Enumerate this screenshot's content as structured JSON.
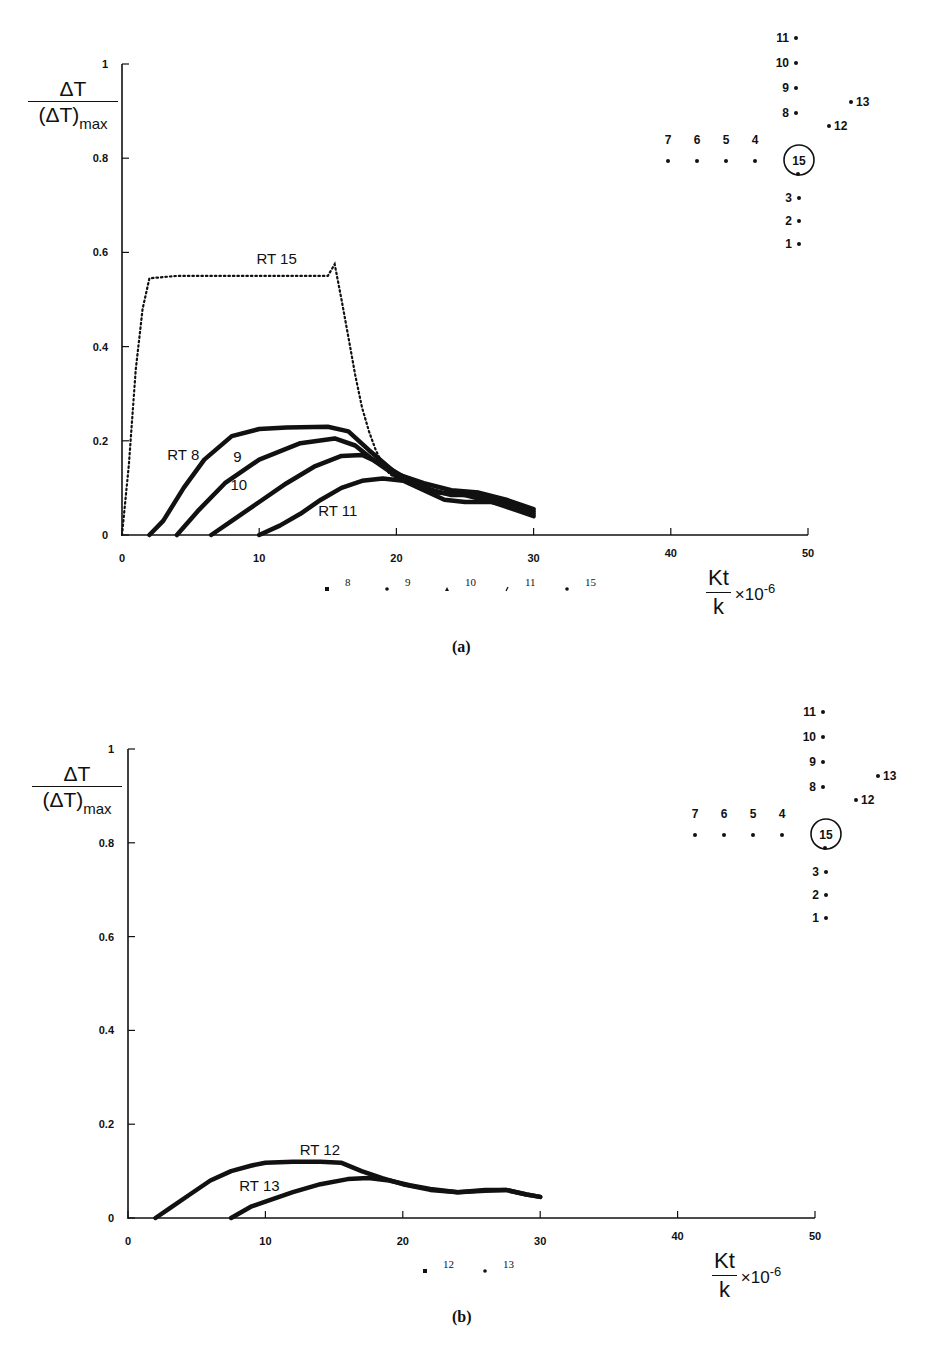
{
  "panels": [
    {
      "caption": "(a)",
      "y_axis_label": {
        "numerator": "ΔT",
        "denominator": "(ΔT)",
        "subscript": "max"
      },
      "x_axis_label": {
        "numerator": "Kt",
        "denominator": "k",
        "multiplier": "×10",
        "exponent": "-6"
      },
      "legend": [
        {
          "marker": "square",
          "label": "8"
        },
        {
          "marker": "dot",
          "label": "9"
        },
        {
          "marker": "triangle",
          "label": "10"
        },
        {
          "marker": "tick",
          "label": "11"
        },
        {
          "marker": "dot",
          "label": "15"
        }
      ],
      "curve_labels": [
        {
          "text": "RT 15",
          "x": 9.8,
          "y": 0.575
        },
        {
          "text": "RT 8",
          "x": 3.3,
          "y": 0.16
        },
        {
          "text": "9",
          "x": 8.1,
          "y": 0.155
        },
        {
          "text": "10",
          "x": 7.9,
          "y": 0.095
        },
        {
          "text": "RT 11",
          "x": 14.3,
          "y": 0.04
        }
      ],
      "sensor_diagram": {
        "vertical_up": [
          "11",
          "10",
          "9",
          "8"
        ],
        "horizontal_left": [
          "7",
          "6",
          "5",
          "4"
        ],
        "vertical_down": [
          "3",
          "2",
          "1"
        ],
        "diagonal": [
          "12",
          "13"
        ],
        "center": "15"
      }
    },
    {
      "caption": "(b)",
      "y_axis_label": {
        "numerator": "ΔT",
        "denominator": "(ΔT)",
        "subscript": "max"
      },
      "x_axis_label": {
        "numerator": "Kt",
        "denominator": "k",
        "multiplier": "×10",
        "exponent": "-6"
      },
      "legend": [
        {
          "marker": "square",
          "label": "12"
        },
        {
          "marker": "dot",
          "label": "13"
        }
      ],
      "curve_labels": [
        {
          "text": "RT 12",
          "x": 12.5,
          "y": 0.135
        },
        {
          "text": "RT 13",
          "x": 8.1,
          "y": 0.058
        }
      ],
      "sensor_diagram": {
        "vertical_up": [
          "11",
          "10",
          "9",
          "8"
        ],
        "horizontal_left": [
          "7",
          "6",
          "5",
          "4"
        ],
        "vertical_down": [
          "3",
          "2",
          "1"
        ],
        "diagonal": [
          "12",
          "13"
        ],
        "center": "15"
      }
    }
  ],
  "chart_data": [
    {
      "type": "scatter",
      "title": "(a)",
      "xlabel": "Kt/k ×10^-6",
      "ylabel": "ΔT/(ΔT)max",
      "xlim": [
        0,
        50
      ],
      "ylim": [
        0,
        1
      ],
      "x_ticks": [
        0,
        10,
        20,
        30,
        40,
        50
      ],
      "y_ticks": [
        0,
        0.2,
        0.4,
        0.6,
        0.8,
        1
      ],
      "grid": false,
      "legend_position": "below x-axis",
      "series": [
        {
          "name": "RT 15",
          "marker": "dot",
          "x": [
            0,
            0.5,
            1.0,
            1.5,
            2.0,
            4,
            6,
            8,
            10,
            12,
            14,
            15,
            15.5,
            16,
            16.5,
            17,
            17.5,
            18,
            18.5,
            19,
            19.5,
            20
          ],
          "y": [
            0,
            0.15,
            0.35,
            0.48,
            0.545,
            0.55,
            0.55,
            0.55,
            0.55,
            0.55,
            0.55,
            0.55,
            0.575,
            0.5,
            0.42,
            0.34,
            0.27,
            0.22,
            0.18,
            0.15,
            0.13,
            0.12
          ]
        },
        {
          "name": "RT 8",
          "marker": "square",
          "x": [
            2,
            3,
            4.5,
            6,
            8,
            10,
            12,
            15,
            16.5,
            18,
            20,
            22,
            24,
            26,
            28,
            30
          ],
          "y": [
            0,
            0.03,
            0.1,
            0.16,
            0.21,
            0.225,
            0.228,
            0.23,
            0.22,
            0.18,
            0.13,
            0.11,
            0.095,
            0.09,
            0.075,
            0.055
          ]
        },
        {
          "name": "9",
          "marker": "dot",
          "x": [
            4,
            5.5,
            7.5,
            10,
            13,
            15.5,
            17,
            18.5,
            20,
            22,
            24,
            26,
            28,
            30
          ],
          "y": [
            0,
            0.05,
            0.11,
            0.16,
            0.195,
            0.205,
            0.19,
            0.155,
            0.125,
            0.1,
            0.085,
            0.085,
            0.07,
            0.05
          ]
        },
        {
          "name": "10",
          "marker": "triangle",
          "x": [
            6.5,
            8,
            10,
            12,
            14,
            16,
            17.5,
            19,
            21,
            23,
            25,
            27,
            29,
            30
          ],
          "y": [
            0,
            0.03,
            0.07,
            0.11,
            0.145,
            0.168,
            0.17,
            0.15,
            0.115,
            0.09,
            0.085,
            0.07,
            0.05,
            0.04
          ]
        },
        {
          "name": "RT 11",
          "marker": "tick",
          "x": [
            10,
            11.5,
            13,
            14.5,
            16,
            17.5,
            19,
            20.5,
            22,
            23.5,
            25,
            27,
            29,
            30
          ],
          "y": [
            0,
            0.02,
            0.045,
            0.075,
            0.1,
            0.115,
            0.12,
            0.115,
            0.095,
            0.075,
            0.07,
            0.07,
            0.055,
            0.045
          ]
        }
      ]
    },
    {
      "type": "scatter",
      "title": "(b)",
      "xlabel": "Kt/k ×10^-6",
      "ylabel": "ΔT/(ΔT)max",
      "xlim": [
        0,
        50
      ],
      "ylim": [
        0,
        1
      ],
      "x_ticks": [
        0,
        10,
        20,
        30,
        40,
        50
      ],
      "y_ticks": [
        0,
        0.2,
        0.4,
        0.6,
        0.8,
        1
      ],
      "grid": false,
      "legend_position": "below x-axis",
      "series": [
        {
          "name": "RT 12",
          "marker": "square",
          "x": [
            2,
            3,
            4.5,
            6,
            7.5,
            9,
            10,
            12,
            14,
            15.5,
            17,
            18.5,
            20,
            22,
            24,
            26,
            27.5,
            29,
            30
          ],
          "y": [
            0,
            0.02,
            0.05,
            0.08,
            0.1,
            0.112,
            0.118,
            0.12,
            0.12,
            0.118,
            0.1,
            0.085,
            0.072,
            0.06,
            0.055,
            0.06,
            0.06,
            0.05,
            0.045
          ]
        },
        {
          "name": "RT 13",
          "marker": "dot",
          "x": [
            7.5,
            9,
            10,
            12,
            14,
            16,
            17.5,
            19,
            20.5,
            22,
            24,
            26,
            27.5,
            29,
            30
          ],
          "y": [
            0,
            0.025,
            0.035,
            0.055,
            0.072,
            0.083,
            0.085,
            0.08,
            0.07,
            0.062,
            0.055,
            0.058,
            0.06,
            0.05,
            0.045
          ]
        }
      ]
    }
  ]
}
